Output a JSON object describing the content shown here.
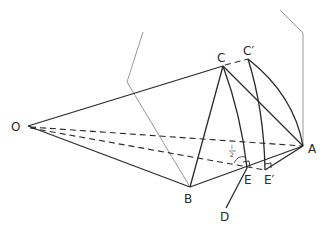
{
  "diagram": {
    "type": "geometric-construction",
    "points": {
      "O": {
        "label": "O",
        "x": 28,
        "y": 126
      },
      "C": {
        "label": "C",
        "x": 223,
        "y": 66
      },
      "C_prime": {
        "label": "C′",
        "x": 248,
        "y": 59
      },
      "A": {
        "label": "A",
        "x": 303,
        "y": 146
      },
      "B": {
        "label": "B",
        "x": 190,
        "y": 187
      },
      "E": {
        "label": "E",
        "x": 247,
        "y": 168
      },
      "E_prime": {
        "label": "E′",
        "x": 265,
        "y": 170
      },
      "D": {
        "label": "D",
        "x": 226,
        "y": 208
      }
    },
    "angle_label": {
      "numerator": "i",
      "denominator": "2"
    },
    "colors": {
      "solid": "#2a2a2a",
      "dashed": "#2a2a2a",
      "grey": "#9a9a9a"
    }
  }
}
